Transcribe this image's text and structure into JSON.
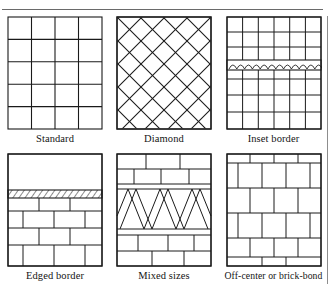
{
  "figure": {
    "title_rule": "horizontal-rule",
    "stroke_color": "#1a1a1a",
    "background_color": "#ffffff",
    "panel_count": 6,
    "panels": [
      {
        "id": "standard",
        "caption": "Standard",
        "pattern": "square-grid",
        "columns": 4,
        "rows": 5,
        "description": "Plain stacked square tile grid, four columns by five rows"
      },
      {
        "id": "diamond",
        "caption": "Diamond",
        "pattern": "diagonal-lattice",
        "diagonals_per_direction": 7,
        "description": "Tiles set on the diagonal forming a diamond lattice"
      },
      {
        "id": "inset-border",
        "caption": "Inset border",
        "pattern": "square-grid-with-scalloped-band",
        "columns": 6,
        "rows": 6,
        "band_row_index": 3,
        "band_motif": "scallop-arches",
        "band_scallops": 12,
        "description": "Square grid interrupted by a narrow decorative scalloped inset band"
      },
      {
        "id": "edged-border",
        "caption": "Edged border",
        "pattern": "running-bond-with-hatched-band",
        "rows": 5,
        "band_row_index": 1,
        "band_motif": "diagonal-hatch",
        "description": "Open field above a diagonally hatched edging band over running-bond brick courses"
      },
      {
        "id": "mixed-sizes",
        "caption": "Mixed sizes",
        "pattern": "mixed-courses-with-diamond-band",
        "band_motif": "diamond-row",
        "band_diamonds": 3,
        "description": "Bands of differently sized rectangular tiles with a central diamond-set course"
      },
      {
        "id": "brick-bond",
        "caption": "Off-center or brick-bond",
        "pattern": "running-bond",
        "columns": 4,
        "rows": 5,
        "offset": "half-tile",
        "description": "Rectangular tiles offset by half a tile each course, brick-bond style"
      }
    ]
  }
}
